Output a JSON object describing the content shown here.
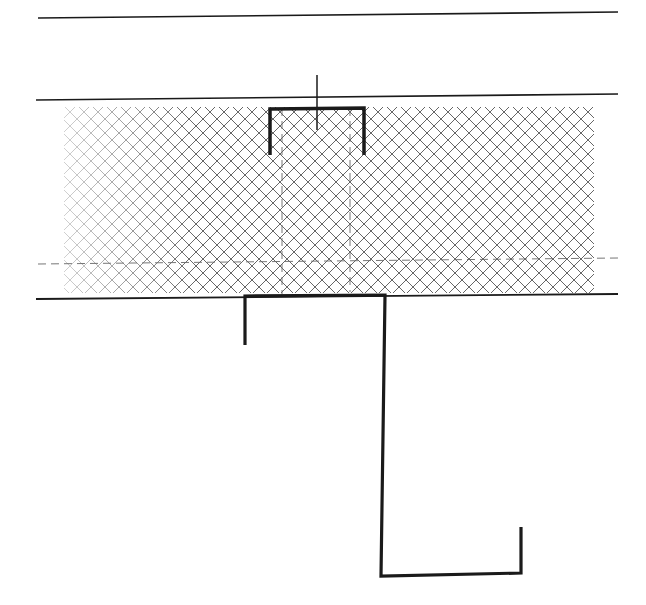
{
  "diagram": {
    "type": "technical-cross-section",
    "background": "#ffffff",
    "line_color": "#1a1a1a",
    "hatch_color": "#555555",
    "dash_color": "#666666",
    "elements": {
      "top_line": {
        "x1": 38,
        "y1": 18,
        "x2": 618,
        "y2": 12
      },
      "panel_top_line": {
        "x1": 36,
        "y1": 100,
        "x2": 618,
        "y2": 94
      },
      "panel_bottom_line": {
        "x1": 36,
        "y1": 299,
        "x2": 618,
        "y2": 294
      },
      "insulation_hatch": {
        "x": 64,
        "y": 107,
        "width": 530,
        "height": 186,
        "spacing": 14
      },
      "horizontal_dashed_line": {
        "x1": 38,
        "y1": 264,
        "x2": 618,
        "y2": 258
      },
      "vertical_dashed_lines": [
        {
          "x1": 282,
          "y1": 108,
          "x2": 282,
          "y2": 294
        },
        {
          "x1": 350,
          "y1": 108,
          "x2": 350,
          "y2": 292
        }
      ],
      "top_channel_path": "M 270 155 L 270 109 L 364 108 L 364 155",
      "top_stem": {
        "x1": 317,
        "y1": 75,
        "x2": 317,
        "y2": 130
      },
      "bottom_z_profile_path": "M 245 345 L 245 296 L 385 295 L 381 576 L 521 573 L 521 527"
    }
  }
}
